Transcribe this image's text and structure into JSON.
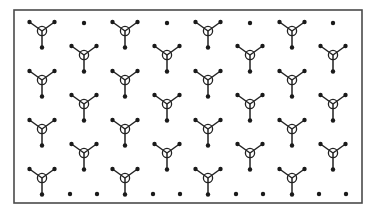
{
  "diagram": {
    "title": "",
    "type": "molecular-lattice",
    "frame": {
      "x": 14,
      "y": 10,
      "width": 348,
      "height": 193,
      "stroke": "#4a4a4a"
    },
    "colors": {
      "bond": "#222222",
      "atom": "#1a1a1a",
      "center_ring": "#222222",
      "background": "#ffffff"
    },
    "molecule_geometry": {
      "center_radius": 4.6,
      "arm_up_left": [
        -12.5,
        -9
      ],
      "arm_up_right": [
        12.5,
        -9
      ],
      "arm_down": [
        0,
        16.5
      ],
      "end_atom_radius": 2.2
    },
    "molecules": [
      {
        "cx": 42,
        "cy": 31
      },
      {
        "cx": 125,
        "cy": 31
      },
      {
        "cx": 208,
        "cy": 31
      },
      {
        "cx": 292,
        "cy": 31
      },
      {
        "cx": 84,
        "cy": 55
      },
      {
        "cx": 167,
        "cy": 55
      },
      {
        "cx": 250,
        "cy": 55
      },
      {
        "cx": 333,
        "cy": 55
      },
      {
        "cx": 42,
        "cy": 80
      },
      {
        "cx": 125,
        "cy": 80
      },
      {
        "cx": 208,
        "cy": 80
      },
      {
        "cx": 292,
        "cy": 80
      },
      {
        "cx": 84,
        "cy": 104
      },
      {
        "cx": 167,
        "cy": 104
      },
      {
        "cx": 250,
        "cy": 104
      },
      {
        "cx": 333,
        "cy": 104
      },
      {
        "cx": 42,
        "cy": 129
      },
      {
        "cx": 125,
        "cy": 129
      },
      {
        "cx": 208,
        "cy": 129
      },
      {
        "cx": 292,
        "cy": 129
      },
      {
        "cx": 84,
        "cy": 153
      },
      {
        "cx": 167,
        "cy": 153
      },
      {
        "cx": 250,
        "cy": 153
      },
      {
        "cx": 333,
        "cy": 153
      },
      {
        "cx": 42,
        "cy": 178
      },
      {
        "cx": 125,
        "cy": 178
      },
      {
        "cx": 208,
        "cy": 178
      },
      {
        "cx": 292,
        "cy": 178
      }
    ],
    "isolated_atoms": [
      {
        "x": 84,
        "y": 23
      },
      {
        "x": 167,
        "y": 23
      },
      {
        "x": 250,
        "y": 23
      },
      {
        "x": 333,
        "y": 23
      },
      {
        "x": 70,
        "y": 194
      },
      {
        "x": 97,
        "y": 194
      },
      {
        "x": 153,
        "y": 194
      },
      {
        "x": 180,
        "y": 194
      },
      {
        "x": 236,
        "y": 194
      },
      {
        "x": 263,
        "y": 194
      },
      {
        "x": 319,
        "y": 194
      },
      {
        "x": 346,
        "y": 194
      }
    ]
  }
}
